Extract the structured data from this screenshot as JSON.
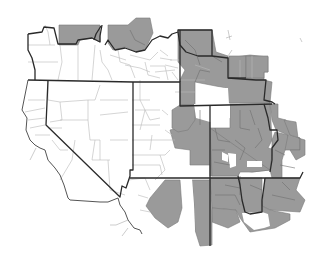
{
  "map": {
    "title": "",
    "description": "Grayscale county map of the western United States with shaded counties",
    "colors": {
      "background": "#ffffff",
      "shaded_county": "#9a9a9a",
      "unshaded_county": "#ffffff",
      "state_border": "#2a2a2a",
      "county_border": "#b8b8b8"
    },
    "regions": [
      {
        "name": "Washington (north, partial)",
        "shading": "mostly unshaded"
      },
      {
        "name": "Idaho/Montana north border",
        "shading": "shaded"
      },
      {
        "name": "Oregon",
        "shading": "unshaded"
      },
      {
        "name": "Idaho",
        "shading": "unshaded"
      },
      {
        "name": "Montana / Wyoming east",
        "shading": "shaded"
      },
      {
        "name": "Nevada",
        "shading": "unshaded"
      },
      {
        "name": "Utah",
        "shading": "mostly unshaded, east edge shaded"
      },
      {
        "name": "Colorado",
        "shading": "shaded with a few unshaded counties"
      },
      {
        "name": "California (east edge)",
        "shading": "unshaded"
      },
      {
        "name": "Arizona",
        "shading": "partially shaded"
      },
      {
        "name": "New Mexico",
        "shading": "shaded"
      }
    ]
  }
}
